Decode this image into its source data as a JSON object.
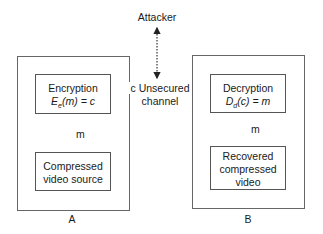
{
  "attacker": {
    "label": "Attacker"
  },
  "channel": {
    "symbol": "c",
    "label_line1": "Unsecured",
    "label_line2": "channel"
  },
  "party_a": {
    "label": "A",
    "encryption": {
      "title": "Encryption",
      "formula_fn": "E",
      "formula_sub": "e",
      "formula_rest": "(m) = c"
    },
    "source": {
      "line1": "Compressed",
      "line2": "video source"
    },
    "arrow_label": "m"
  },
  "party_b": {
    "label": "B",
    "decryption": {
      "title": "Decryption",
      "formula_fn": "D",
      "formula_sub": "d",
      "formula_rest": "(c) = m"
    },
    "output": {
      "line1": "Recovered",
      "line2": "compressed",
      "line3": "video"
    },
    "arrow_label": "m"
  }
}
